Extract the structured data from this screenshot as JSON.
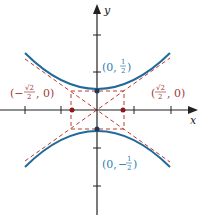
{
  "figure": {
    "axes": {
      "x_label": "x",
      "y_label": "y"
    },
    "colors": {
      "curve": "#1f6a9a",
      "asymptote": "#c0392b",
      "axis": "#222222",
      "point_label_blue": "#2e7fb0",
      "point_label_red": "#a23a3a"
    },
    "labels": {
      "top_vertex": {
        "prefix": "(0, ",
        "num": "1",
        "den": "2",
        "suffix": ")"
      },
      "bottom_vertex": {
        "prefix": "(0, −",
        "num": "1",
        "den": "2",
        "suffix": ")"
      },
      "left_focus_like": {
        "prefix": "(−",
        "num": "√2",
        "den": "2",
        "suffix": ", 0)"
      },
      "right_focus_like": {
        "prefix": "(",
        "num": "√2",
        "den": "2",
        "suffix": ", 0)"
      }
    },
    "points": [
      {
        "name": "top-vertex",
        "x": 0,
        "y": 0.5
      },
      {
        "name": "bottom-vertex",
        "x": 0,
        "y": -0.5
      },
      {
        "name": "left-point",
        "x": -0.7071,
        "y": 0
      },
      {
        "name": "right-point",
        "x": 0.7071,
        "y": 0
      }
    ]
  }
}
